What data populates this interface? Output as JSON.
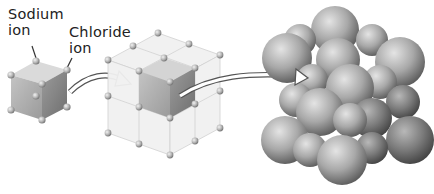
{
  "figure": {
    "labels": {
      "sodium_line1": "Sodium",
      "sodium_line2": "ion",
      "chloride_line1": "Chloride",
      "chloride_line2": "ion"
    },
    "panels": [
      {
        "name": "unit-cell",
        "description": "single cubic unit cell with ions at corners"
      },
      {
        "name": "lattice",
        "description": "2x2x2 cubic lattice with highlighted unit cell"
      },
      {
        "name": "space-filling-model",
        "description": "packed spheres of sodium and chloride ions"
      }
    ],
    "colors": {
      "background": "#ffffff",
      "cube_face_front": "#a9a9a9",
      "cube_face_top": "#d6d6d6",
      "cube_face_side": "#8c8c8c",
      "lattice_lines": "#cfcfcf",
      "sphere_dark": "#6b6b6b",
      "sphere_light": "#d8d8d8",
      "text": "#222222"
    }
  }
}
